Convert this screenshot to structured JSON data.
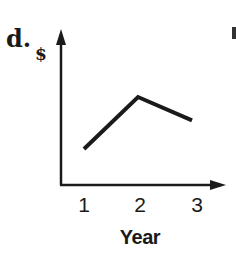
{
  "panel": {
    "label": "d."
  },
  "chart_data": {
    "type": "line",
    "title": "",
    "xlabel": "Year",
    "ylabel": "$",
    "categories": [
      "1",
      "2",
      "3"
    ],
    "x": [
      1,
      2,
      3
    ],
    "series": [
      {
        "name": "$",
        "values": [
          1.0,
          2.0,
          1.55
        ]
      }
    ],
    "y_ticks": [],
    "grid": false,
    "legend": null,
    "note": "Qualitative sketch: value rises from year 1 to a peak at year 2, then declines at year 3 (no y-axis scale shown)",
    "line_color": "#1a1a1a"
  },
  "axes": {
    "y_label": "$",
    "x_label": "Year",
    "x_ticks": [
      "1",
      "2",
      "3"
    ]
  }
}
